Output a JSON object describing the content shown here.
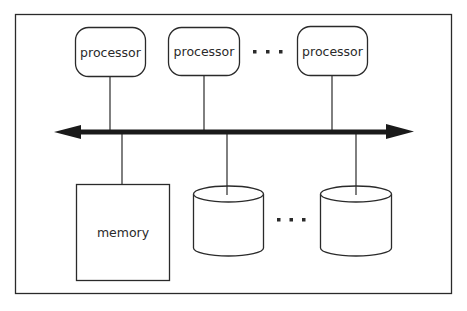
{
  "diagram": {
    "type": "shared-bus architecture",
    "colors": {
      "stroke": "#2a2a2a",
      "bus": "#1a1a1a",
      "background": "#ffffff"
    },
    "processors": [
      {
        "label": "processor"
      },
      {
        "label": "processor"
      },
      {
        "label": "processor"
      }
    ],
    "processor_ellipsis": "...",
    "bus": {
      "direction": "bidirectional"
    },
    "memory": {
      "label": "memory"
    },
    "disks": [
      {
        "label": ""
      },
      {
        "label": ""
      }
    ],
    "disk_ellipsis": "..."
  }
}
